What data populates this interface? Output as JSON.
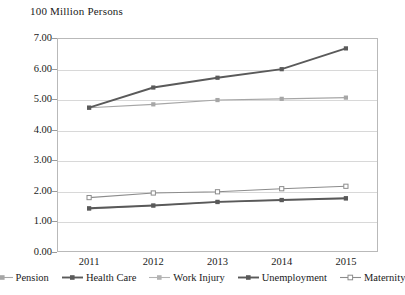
{
  "chart_data": {
    "type": "line",
    "title": "100 Million Persons",
    "xlabel": "",
    "ylabel": "",
    "categories": [
      "2011",
      "2012",
      "2013",
      "2014",
      "2015"
    ],
    "ylim": [
      0.0,
      7.0
    ],
    "ytick_step": 1.0,
    "ytick_labels": [
      "0.00",
      "1.00",
      "2.00",
      "3.00",
      "4.00",
      "5.00",
      "6.00",
      "7.00"
    ],
    "grid": true,
    "legend_position": "bottom",
    "series": [
      {
        "name": "Pension",
        "color": "#a6a6a6",
        "marker": "square",
        "values": [
          4.72,
          4.83,
          4.97,
          5.01,
          5.05
        ]
      },
      {
        "name": "Health Care",
        "color": "#5a5a5a",
        "marker": "square",
        "values": [
          4.72,
          5.38,
          5.7,
          5.98,
          6.66
        ]
      },
      {
        "name": "Work Injury",
        "color": "#b3b3b3",
        "marker": "square",
        "values": [
          1.41,
          1.52,
          1.63,
          1.7,
          1.74
        ]
      },
      {
        "name": "Unemployment",
        "color": "#595959",
        "marker": "square",
        "values": [
          1.43,
          1.52,
          1.64,
          1.7,
          1.76
        ]
      },
      {
        "name": "Maternity",
        "color": "#8c8c8c",
        "marker": "square-open",
        "values": [
          1.78,
          1.93,
          1.97,
          2.07,
          2.15
        ]
      }
    ]
  }
}
